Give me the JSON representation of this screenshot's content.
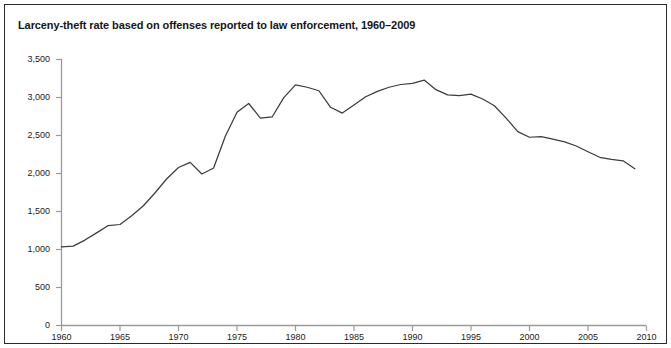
{
  "chart_data": {
    "type": "line",
    "title": "Larceny-theft rate based on offenses reported to law enforcement, 1960–2009",
    "xlabel": "",
    "ylabel": "",
    "xlim": [
      1960,
      2010
    ],
    "ylim": [
      0,
      3500
    ],
    "grid": false,
    "legend": "none",
    "y_ticks": [
      "0",
      "500",
      "1,000",
      "1,500",
      "2,000",
      "2,500",
      "3,000",
      "3,500"
    ],
    "y_tick_values": [
      0,
      500,
      1000,
      1500,
      2000,
      2500,
      3000,
      3500
    ],
    "x_ticks": [
      "1960",
      "1965",
      "1970",
      "1975",
      "1980",
      "1985",
      "1990",
      "1995",
      "2000",
      "2005",
      "2010"
    ],
    "x_tick_values": [
      1960,
      1965,
      1970,
      1975,
      1980,
      1985,
      1990,
      1995,
      2000,
      2005,
      2010
    ],
    "line_color": "#3c3c3c",
    "x": [
      1960,
      1961,
      1962,
      1963,
      1964,
      1965,
      1966,
      1967,
      1968,
      1969,
      1970,
      1971,
      1972,
      1973,
      1974,
      1975,
      1976,
      1977,
      1978,
      1979,
      1980,
      1981,
      1982,
      1983,
      1984,
      1985,
      1986,
      1987,
      1988,
      1989,
      1990,
      1991,
      1992,
      1993,
      1994,
      1995,
      1996,
      1997,
      1998,
      1999,
      2000,
      2001,
      2002,
      2003,
      2004,
      2005,
      2006,
      2007,
      2008,
      2009
    ],
    "values": [
      1035,
      1045,
      1124,
      1219,
      1315,
      1329,
      1443,
      1576,
      1747,
      1931,
      2079,
      2146,
      1994,
      2072,
      2490,
      2805,
      2921,
      2730,
      2744,
      2999,
      3167,
      3135,
      3089,
      2871,
      2795,
      2901,
      3010,
      3081,
      3135,
      3171,
      3185,
      3229,
      3103,
      3034,
      3026,
      3044,
      2980,
      2891,
      2729,
      2551,
      2477,
      2486,
      2451,
      2416,
      2362,
      2287,
      2213,
      2185,
      2167,
      2061
    ],
    "series": [
      {
        "name": "Larceny-theft rate per 100,000 inhabitants",
        "values": [
          1035,
          1045,
          1124,
          1219,
          1315,
          1329,
          1443,
          1576,
          1747,
          1931,
          2079,
          2146,
          1994,
          2072,
          2490,
          2805,
          2921,
          2730,
          2744,
          2999,
          3167,
          3135,
          3089,
          2871,
          2795,
          2901,
          3010,
          3081,
          3135,
          3171,
          3185,
          3229,
          3103,
          3034,
          3026,
          3044,
          2980,
          2891,
          2729,
          2551,
          2477,
          2486,
          2451,
          2416,
          2362,
          2287,
          2213,
          2185,
          2167,
          2061
        ]
      }
    ]
  }
}
